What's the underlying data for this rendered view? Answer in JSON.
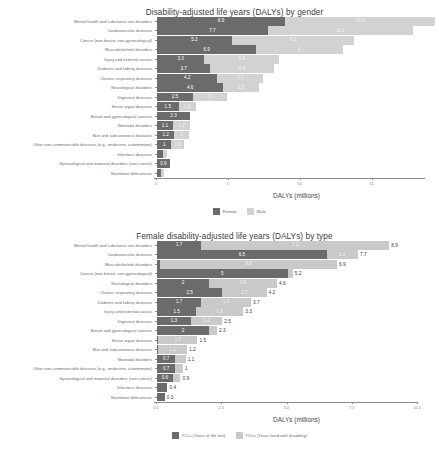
{
  "charts": [
    {
      "id": "dalys-by-gender",
      "title": "Disability-adjusted life years (DALYs) by gender",
      "xlabel": "DALYs (millions)",
      "ticks": [
        "0",
        "5",
        "10",
        "15"
      ],
      "legend": [
        {
          "label": "Female",
          "color": "#6b6b6b"
        },
        {
          "label": "Male",
          "color": "#d2d2d2"
        }
      ]
    },
    {
      "id": "female-dalys-by-type",
      "title": "Female disability-adjusted life years (DALYs) by type",
      "xlabel": "DALYs (millions)",
      "ticks": [
        "0.0",
        "2.5",
        "5.0",
        "7.5",
        "10.0"
      ],
      "legend": [
        {
          "label": "YLLs (Years of life lost)",
          "color": "#6b6b6b"
        },
        {
          "label": "YLDs (Years lived with disability)",
          "color": "#c9c9c9"
        }
      ]
    }
  ],
  "chart_data": [
    {
      "type": "bar",
      "orientation": "horizontal-stacked",
      "title": "Disability-adjusted life years (DALYs) by gender",
      "xlabel": "DALYs (millions)",
      "ylabel": "",
      "xlim": [
        0,
        18.7
      ],
      "ticks": [
        0,
        5,
        10,
        15
      ],
      "grid": false,
      "legend_position": "bottom",
      "categories": [
        "Mental health and substance use disorders",
        "Cardiovascular diseases",
        "Cancer (non-breast, non-gynecological)",
        "Musculoskeletal disorders",
        "Injury and external causes",
        "Diabetes and kidney diseases",
        "Chronic respiratory diseases",
        "Neurological disorders",
        "Digestive diseases",
        "Sense organ diseases",
        "Breast and gynecological cancers",
        "Neonatal disorders",
        "Skin and subcutaneous diseases",
        "Other non-communicable diseases (e.g., endocrine, autoimmune)",
        "Infectious diseases",
        "Gynecological and maternal disorders (non-cancer)",
        "Nutritional deficiencies"
      ],
      "series": [
        {
          "name": "Female",
          "color": "#6b6b6b",
          "values": [
            8.9,
            7.7,
            5.2,
            6.9,
            3.3,
            3.7,
            4.2,
            4.6,
            2.5,
            1.5,
            2.3,
            1.1,
            1.2,
            1.0,
            0.4,
            0.9,
            0.3
          ],
          "labels": [
            "8.9",
            "7.7",
            "5.2",
            "6.9",
            "3.3",
            "3.7",
            "4.2",
            "4.6",
            "2.5",
            "1.5",
            "2.3",
            "1.1",
            "1.2",
            "1",
            "",
            "0.9",
            ""
          ]
        },
        {
          "name": "Male",
          "color": "#d2d2d2",
          "values": [
            10.4,
            10.1,
            8.5,
            6.0,
            5.2,
            4.4,
            3.2,
            2.5,
            2.4,
            1.2,
            0.0,
            1.2,
            1.0,
            0.9,
            0.3,
            0.0,
            0.2
          ],
          "labels": [
            "10.4",
            "10.1",
            "8.5",
            "6",
            "5.2",
            "4.4",
            "3.2",
            "2.5",
            "2.4",
            "1.2",
            "",
            "1.2",
            "1",
            "0.9",
            "",
            "",
            ""
          ]
        }
      ]
    },
    {
      "type": "bar",
      "orientation": "horizontal-stacked",
      "title": "Female disability-adjusted life years (DALYs) by type",
      "xlabel": "DALYs (millions)",
      "ylabel": "",
      "xlim": [
        0,
        10.0
      ],
      "ticks": [
        0.0,
        2.5,
        5.0,
        7.5,
        10.0
      ],
      "grid": false,
      "legend_position": "bottom",
      "categories": [
        "Mental health and substance use disorders",
        "Cardiovascular diseases",
        "Musculoskeletal disorders",
        "Cancer (non-breast, non-gynecological)",
        "Neurological disorders",
        "Chronic respiratory diseases",
        "Diabetes and kidney diseases",
        "Injury and external causes",
        "Digestive diseases",
        "Breast and gynecological cancers",
        "Sense organ diseases",
        "Skin and subcutaneous diseases",
        "Neonatal disorders",
        "Other non-communicable diseases (e.g., endocrine, autoimmune)",
        "Gynecological and maternal disorders (non-cancer)",
        "Infectious diseases",
        "Nutritional deficiencies"
      ],
      "series": [
        {
          "name": "YLLs (Years of life lost)",
          "color": "#6b6b6b",
          "values": [
            1.7,
            6.5,
            0.1,
            5.0,
            2.0,
            2.5,
            1.7,
            1.5,
            1.3,
            2.0,
            0.05,
            0.05,
            0.7,
            0.7,
            0.6,
            0.4,
            0.3
          ],
          "labels": [
            "1.7",
            "6.5",
            "",
            "5",
            "2",
            "2.5",
            "1.7",
            "1.5",
            "1.3",
            "2",
            "",
            "",
            "0.7",
            "0.7",
            "0.6",
            "",
            ""
          ]
        },
        {
          "name": "YLDs (Years lived with disability)",
          "color": "#c9c9c9",
          "values": [
            7.2,
            1.2,
            6.8,
            0.2,
            2.6,
            1.7,
            1.9,
            1.8,
            1.2,
            0.3,
            1.5,
            1.1,
            0.4,
            0.3,
            0.3,
            0.0,
            0.0
          ],
          "labels": [
            "7.2",
            "1.2",
            "6.8",
            "",
            "2.6",
            "1.7",
            "1.9",
            "1.8",
            "1.2",
            "",
            "1.5",
            "1.1",
            "",
            "",
            "",
            "",
            ""
          ]
        }
      ],
      "totals": [
        "8.9",
        "7.7",
        "6.9",
        "5.2",
        "4.6",
        "4.2",
        "3.7",
        "3.3",
        "2.5",
        "2.3",
        "1.5",
        "1.2",
        "1.1",
        "1",
        "0.9",
        "0.4",
        "0.3"
      ],
      "total_values": [
        8.9,
        7.7,
        6.9,
        5.2,
        4.6,
        4.2,
        3.7,
        3.3,
        2.5,
        2.3,
        1.5,
        1.2,
        1.1,
        1.0,
        0.9,
        0.4,
        0.3
      ]
    }
  ]
}
